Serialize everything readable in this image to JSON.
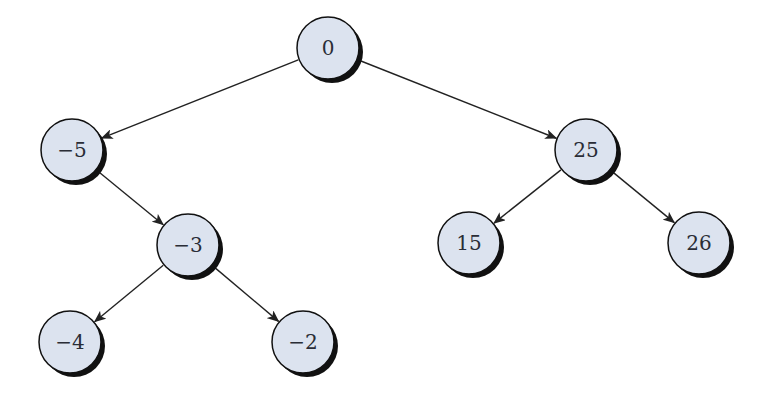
{
  "diagram": {
    "type": "binary-search-tree",
    "colors": {
      "node_fill": "#dce3ef",
      "node_stroke": "#111111",
      "shadow": "#111111",
      "edge": "#222222",
      "label": "#2a2d36",
      "background": "#ffffff"
    },
    "nodes": [
      {
        "id": "n0",
        "label": "0",
        "cx": 328,
        "cy": 48
      },
      {
        "id": "nm5",
        "label": "−5",
        "cx": 72,
        "cy": 150
      },
      {
        "id": "n25",
        "label": "25",
        "cx": 586,
        "cy": 150
      },
      {
        "id": "nm3",
        "label": "−3",
        "cx": 188,
        "cy": 245
      },
      {
        "id": "n15",
        "label": "15",
        "cx": 469,
        "cy": 243
      },
      {
        "id": "n26",
        "label": "26",
        "cx": 699,
        "cy": 243
      },
      {
        "id": "nm4",
        "label": "−4",
        "cx": 70,
        "cy": 342
      },
      {
        "id": "nm2",
        "label": "−2",
        "cx": 303,
        "cy": 342
      }
    ],
    "edges": [
      {
        "from": "n0",
        "to": "nm5"
      },
      {
        "from": "n0",
        "to": "n25"
      },
      {
        "from": "nm5",
        "to": "nm3"
      },
      {
        "from": "nm3",
        "to": "nm4"
      },
      {
        "from": "nm3",
        "to": "nm2"
      },
      {
        "from": "n25",
        "to": "n15"
      },
      {
        "from": "n25",
        "to": "n26"
      }
    ],
    "node_radius": 31
  }
}
